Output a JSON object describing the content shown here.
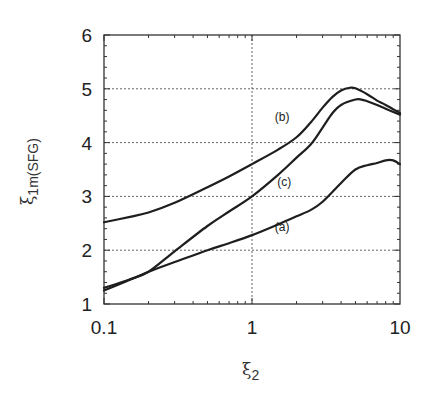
{
  "chart_data": {
    "type": "line",
    "title": "",
    "xlabel": "ξ2",
    "ylabel": "ξ1m(SFG)",
    "xscale": "log",
    "xlim": [
      0.1,
      10
    ],
    "ylim": [
      1,
      6
    ],
    "grid": true,
    "legend": "none (inline curve labels)",
    "x_ticks": [
      "0.1",
      "1",
      "10"
    ],
    "y_ticks": [
      "1",
      "2",
      "3",
      "4",
      "5",
      "6"
    ],
    "series": [
      {
        "name": "(a)",
        "x": [
          0.1,
          0.15,
          0.2,
          0.3,
          0.5,
          0.7,
          1.0,
          1.5,
          2.0,
          2.5,
          3.0,
          4.0,
          5.0,
          6.0,
          7.0,
          8.0,
          9.0,
          10.0
        ],
        "values": [
          1.25,
          1.45,
          1.6,
          1.78,
          2.0,
          2.13,
          2.28,
          2.48,
          2.63,
          2.75,
          2.9,
          3.25,
          3.5,
          3.58,
          3.62,
          3.67,
          3.67,
          3.6
        ]
      },
      {
        "name": "(b)",
        "x": [
          0.1,
          0.15,
          0.2,
          0.3,
          0.5,
          0.7,
          1.0,
          1.5,
          2.0,
          2.5,
          3.0,
          3.5,
          4.0,
          4.6,
          5.0,
          6.0,
          7.0,
          8.0,
          10.0
        ],
        "values": [
          2.52,
          2.62,
          2.7,
          2.88,
          3.17,
          3.37,
          3.6,
          3.87,
          4.1,
          4.38,
          4.65,
          4.85,
          4.97,
          5.02,
          5.01,
          4.9,
          4.78,
          4.7,
          4.55
        ]
      },
      {
        "name": "(c)",
        "x": [
          0.1,
          0.15,
          0.2,
          0.3,
          0.5,
          0.7,
          1.0,
          1.5,
          2.0,
          2.5,
          3.0,
          3.5,
          4.0,
          5.0,
          5.5,
          6.0,
          7.0,
          8.0,
          10.0
        ],
        "values": [
          1.3,
          1.46,
          1.6,
          1.98,
          2.45,
          2.72,
          3.0,
          3.4,
          3.72,
          3.97,
          4.28,
          4.55,
          4.7,
          4.8,
          4.8,
          4.77,
          4.7,
          4.63,
          4.52
        ]
      }
    ],
    "annotations": [
      {
        "text": "(b)",
        "x": 1.6,
        "y": 4.4
      },
      {
        "text": "(c)",
        "x": 1.65,
        "y": 3.2
      },
      {
        "text": "(a)",
        "x": 1.6,
        "y": 2.35
      }
    ]
  },
  "labels": {
    "ylabel_main": "ξ",
    "ylabel_sub": "1m(SFG)",
    "xlabel_main": "ξ",
    "xlabel_sub": "2"
  }
}
